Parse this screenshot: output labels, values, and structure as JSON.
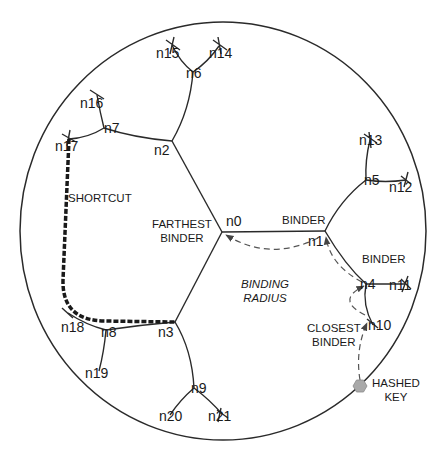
{
  "colors": {
    "line": "#2a2a2a",
    "dashed": "#555555",
    "shortcut": "#1a1a1a",
    "hashed_key": "#a9a9a9",
    "background": "#ffffff"
  },
  "ring": {
    "cx": 223,
    "cy": 231,
    "rx": 203,
    "ry": 209
  },
  "nodes": [
    {
      "id": "n0",
      "label": "n0",
      "x": 222,
      "y": 232,
      "lx": 226,
      "ly": 214
    },
    {
      "id": "n1",
      "label": "n1",
      "x": 325,
      "y": 231,
      "lx": 308,
      "ly": 234
    },
    {
      "id": "n2",
      "label": "n2",
      "x": 172,
      "y": 141,
      "lx": 154,
      "ly": 143
    },
    {
      "id": "n3",
      "label": "n3",
      "x": 175,
      "y": 322,
      "lx": 158,
      "ly": 325
    },
    {
      "id": "n4",
      "label": "n4",
      "x": 366,
      "y": 284,
      "lx": 360,
      "ly": 277
    },
    {
      "id": "n5",
      "label": "n5",
      "x": 366,
      "y": 180,
      "lx": 364,
      "ly": 173
    },
    {
      "id": "n6",
      "label": "n6",
      "x": 193,
      "y": 72,
      "lx": 186,
      "ly": 66
    },
    {
      "id": "n7",
      "label": "n7",
      "x": 104,
      "y": 128,
      "lx": 104,
      "ly": 121
    },
    {
      "id": "n8",
      "label": "n8",
      "x": 106,
      "y": 330,
      "lx": 101,
      "ly": 325
    },
    {
      "id": "n9",
      "label": "n9",
      "x": 194,
      "y": 388,
      "lx": 191,
      "ly": 381
    },
    {
      "id": "n10",
      "label": "n10",
      "x": 373,
      "y": 325,
      "lx": 368,
      "ly": 318
    },
    {
      "id": "n11",
      "label": "n11",
      "x": 405,
      "y": 284,
      "lx": 389,
      "ly": 278
    },
    {
      "id": "n12",
      "label": "n12",
      "x": 406,
      "y": 180,
      "lx": 389,
      "ly": 180
    },
    {
      "id": "n13",
      "label": "n13",
      "x": 370,
      "y": 140,
      "lx": 359,
      "ly": 133
    },
    {
      "id": "n14",
      "label": "n14",
      "x": 219,
      "y": 46,
      "lx": 209,
      "ly": 46
    },
    {
      "id": "n15",
      "label": "n15",
      "x": 172,
      "y": 45,
      "lx": 156,
      "ly": 46
    },
    {
      "id": "n16",
      "label": "n16",
      "x": 97,
      "y": 95,
      "lx": 80,
      "ly": 96
    },
    {
      "id": "n17",
      "label": "n17",
      "x": 69,
      "y": 139,
      "lx": 55,
      "ly": 139
    },
    {
      "id": "n18",
      "label": "n18",
      "x": 68,
      "y": 313,
      "lx": 61,
      "ly": 320
    },
    {
      "id": "n19",
      "label": "n19",
      "x": 99,
      "y": 371,
      "lx": 85,
      "ly": 366
    },
    {
      "id": "n20",
      "label": "n20",
      "x": 170,
      "y": 415,
      "lx": 159,
      "ly": 409
    },
    {
      "id": "n21",
      "label": "n21",
      "x": 222,
      "y": 414,
      "lx": 208,
      "ly": 409
    }
  ],
  "edges": [
    [
      "n0",
      "n1"
    ],
    [
      "n0",
      "n2"
    ],
    [
      "n0",
      "n3"
    ],
    [
      "n1",
      "n5"
    ],
    [
      "n1",
      "n4"
    ],
    [
      "n2",
      "n6"
    ],
    [
      "n2",
      "n7"
    ],
    [
      "n3",
      "n8"
    ],
    [
      "n3",
      "n9"
    ],
    [
      "n4",
      "n10"
    ],
    [
      "n4",
      "n11"
    ],
    [
      "n5",
      "n12"
    ],
    [
      "n5",
      "n13"
    ],
    [
      "n6",
      "n14"
    ],
    [
      "n6",
      "n15"
    ],
    [
      "n7",
      "n16"
    ],
    [
      "n7",
      "n17"
    ],
    [
      "n8",
      "n18"
    ],
    [
      "n8",
      "n19"
    ],
    [
      "n9",
      "n20"
    ],
    [
      "n9",
      "n21"
    ]
  ],
  "captions": {
    "farthest_binder": {
      "line1": "FARTHEST",
      "line2": "BINDER",
      "x": 152,
      "y": 218
    },
    "binder_top": {
      "text": "BINDER",
      "x": 282,
      "y": 214
    },
    "binder_right": {
      "text": "BINDER",
      "x": 362,
      "y": 253
    },
    "binding_radius": {
      "line1": "BINDING",
      "line2": "RADIUS",
      "x": 241,
      "y": 282
    },
    "closest_binder": {
      "line1": "CLOSEST",
      "line2": "BINDER",
      "x": 307,
      "y": 322
    },
    "hashed_key": {
      "line1": "HASHED",
      "line2": "KEY",
      "x": 372,
      "y": 382
    },
    "shortcut": {
      "text": "SHORTCUT",
      "x": 68,
      "y": 197
    }
  },
  "hashed_key_point": {
    "x": 360,
    "y": 386
  },
  "legend_semantics": {
    "solid_lines": "tree edges",
    "dashed_arrows": "lookup path from hashed key to n0",
    "thick_dashed": "shortcut from n17 to n3"
  }
}
